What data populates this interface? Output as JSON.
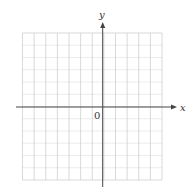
{
  "axes": {
    "x_label": "x",
    "y_label": "y",
    "origin_label": "0"
  },
  "grid": {
    "columns": 12,
    "rows": 12,
    "left": 22.5,
    "top": 33,
    "right": 162,
    "bottom": 180,
    "color": "#cfcfcf"
  },
  "axis_color": "#444444"
}
